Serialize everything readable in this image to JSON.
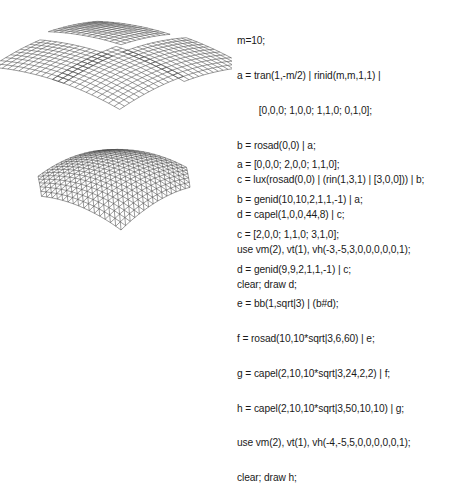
{
  "figures": [
    {
      "name": "mesh-woven-panels",
      "description": "Four curved grid panels interlaced in a woven pattern",
      "code": [
        "m=10;",
        "a = tran(1,-m/2) | rinid(m,m,1,1) |",
        "        [0,0,0; 1,0,0; 1,1,0; 0,1,0];",
        "b = rosad(0,0) | a;",
        "c = lux(rosad(0,0) | (rin(1,3,1) | [3,0,0])) | b;",
        "d = capel(1,0,0,44,8) | c;",
        "use vm(2), vt(1), vh(-3,-5,3,0,0,0,0,0,1);",
        "clear; draw d;"
      ]
    },
    {
      "name": "mesh-triangulated-dome",
      "description": "Hexagonal triangulated dome mesh",
      "code": [
        "a = [0,0,0; 2,0,0; 1,1,0];",
        "b = genid(10,10,2,1,1,-1) | a;",
        "c = [2,0,0; 1,1,0; 3,1,0];",
        "d = genid(9,9,2,1,1,-1) | c;",
        "e = bb(1,sqrt|3) | (b#d);",
        "f = rosad(10,10*sqrt|3,6,60) | e;",
        "g = capel(2,10,10*sqrt|3,24,2,2) | f;",
        "h = capel(2,10,10*sqrt|3,50,10,10) | g;",
        "use vm(2), vt(1), vh(-4,-5,5,0,0,0,0,0,1);",
        "clear; draw h;"
      ]
    }
  ],
  "colors": {
    "text": "#1a1a1a",
    "mesh": "#4a4a4a",
    "background": "#ffffff"
  }
}
